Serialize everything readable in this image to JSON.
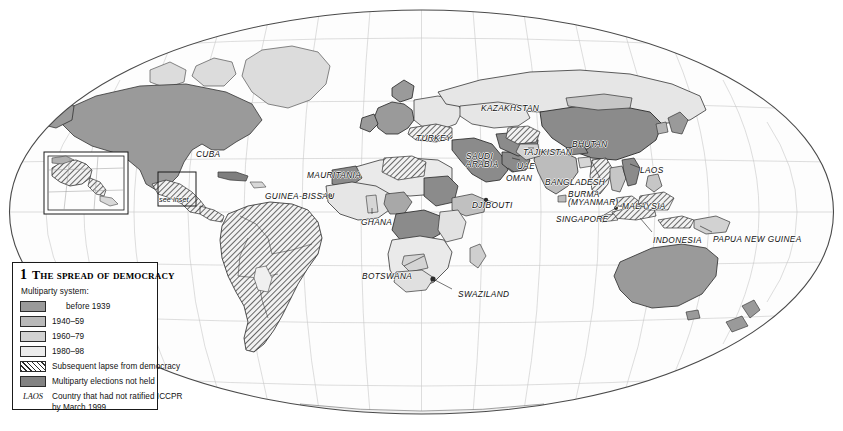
{
  "figure": {
    "number": "1",
    "title": "The spread of democracy",
    "projection": "oval-equal-area",
    "background_color": "#ffffff",
    "outline_color": "#4a4a4a"
  },
  "legend": {
    "subhead": "Multiparty system:",
    "entries": [
      {
        "label": "before 1939",
        "swatch": "solid",
        "color": "#9a9a9a"
      },
      {
        "label": "1940–59",
        "swatch": "solid",
        "color": "#b9b9b9"
      },
      {
        "label": "1960–79",
        "swatch": "solid",
        "color": "#d2d2d2"
      },
      {
        "label": "1980–98",
        "swatch": "solid",
        "color": "#ececec"
      },
      {
        "label": "Subsequent lapse from democracy",
        "swatch": "hatch",
        "color": "#ffffff"
      },
      {
        "label": "Multiparty elections not held",
        "swatch": "solid",
        "color": "#828282"
      }
    ],
    "code_entry": {
      "code": "LAOS",
      "label_line1": "Country that had not ratified ICCPR",
      "label_line2": "by March 1999"
    }
  },
  "map_labels": [
    {
      "id": "cuba",
      "text": "CUBA",
      "x": 196,
      "y": 150
    },
    {
      "id": "see-inset",
      "text": "see inset",
      "x": 159,
      "y": 196,
      "style": "small"
    },
    {
      "id": "mauritania",
      "text": "MAURITANIA",
      "x": 307,
      "y": 171
    },
    {
      "id": "guinea-bissau",
      "text": "GUINEA-BISSAU",
      "x": 265,
      "y": 192
    },
    {
      "id": "ghana",
      "text": "GHANA",
      "x": 361,
      "y": 218
    },
    {
      "id": "botswana",
      "text": "BOTSWANA",
      "x": 362,
      "y": 272
    },
    {
      "id": "swaziland",
      "text": "SWAZILAND",
      "x": 458,
      "y": 290
    },
    {
      "id": "djibouti",
      "text": "DJIBOUTI",
      "x": 472,
      "y": 201
    },
    {
      "id": "turkey",
      "text": "TURKEY",
      "x": 416,
      "y": 134
    },
    {
      "id": "kazakhstan",
      "text": "KAZAKHSTAN",
      "x": 481,
      "y": 104
    },
    {
      "id": "saudi-arabia",
      "text": "SAUDI\nARABIA",
      "x": 466,
      "y": 152
    },
    {
      "id": "uae",
      "text": "UAE",
      "x": 517,
      "y": 162
    },
    {
      "id": "oman",
      "text": "OMAN",
      "x": 506,
      "y": 174
    },
    {
      "id": "tajikistan",
      "text": "TAJIKISTAN",
      "x": 523,
      "y": 148
    },
    {
      "id": "bhutan",
      "text": "BHUTAN",
      "x": 572,
      "y": 140
    },
    {
      "id": "bangladesh",
      "text": "BANGLADESH",
      "x": 545,
      "y": 178
    },
    {
      "id": "laos",
      "text": "LAOS",
      "x": 640,
      "y": 166
    },
    {
      "id": "burma-myanmar",
      "text": "BURMA\n(MYANMAR)",
      "x": 568,
      "y": 190
    },
    {
      "id": "malaysia",
      "text": "MALAYSIA",
      "x": 622,
      "y": 202
    },
    {
      "id": "singapore",
      "text": "SINGAPORE",
      "x": 556,
      "y": 215
    },
    {
      "id": "indonesia",
      "text": "INDONESIA",
      "x": 653,
      "y": 236
    },
    {
      "id": "papua-new-guinea",
      "text": "PAPUA NEW GUINEA",
      "x": 713,
      "y": 235
    }
  ],
  "map_data": {
    "type": "choropleth-world",
    "categories": [
      "before 1939",
      "1940-59",
      "1960-79",
      "1980-98",
      "Subsequent lapse from democracy",
      "Multiparty elections not held"
    ],
    "category_colors": {
      "before 1939": "#9a9a9a",
      "1940-59": "#b9b9b9",
      "1960-79": "#d2d2d2",
      "1980-98": "#ececec",
      "Multiparty elections not held": "#828282",
      "lapse-hatch": "#2b2b2b"
    },
    "regions": [
      {
        "name": "North America (USA/Canada)",
        "category": "before 1939"
      },
      {
        "name": "Greenland",
        "category": "1980-98"
      },
      {
        "name": "Mexico",
        "category": "Subsequent lapse from democracy"
      },
      {
        "name": "Central America",
        "category": "Subsequent lapse from democracy"
      },
      {
        "name": "Cuba",
        "category": "Multiparty elections not held"
      },
      {
        "name": "South America",
        "category": "Subsequent lapse from democracy"
      },
      {
        "name": "Western Europe",
        "category": "before 1939"
      },
      {
        "name": "Eastern Europe",
        "category": "1980-98"
      },
      {
        "name": "Russia",
        "category": "1980-98"
      },
      {
        "name": "Turkey",
        "category": "Subsequent lapse from democracy"
      },
      {
        "name": "Saudi Arabia",
        "category": "Multiparty elections not held"
      },
      {
        "name": "Oman / UAE",
        "category": "Multiparty elections not held"
      },
      {
        "name": "Kazakhstan",
        "category": "1980-98"
      },
      {
        "name": "Tajikistan",
        "category": "Subsequent lapse from democracy"
      },
      {
        "name": "China",
        "category": "Multiparty elections not held"
      },
      {
        "name": "India",
        "category": "1940-59"
      },
      {
        "name": "Bhutan",
        "category": "Multiparty elections not held"
      },
      {
        "name": "Bangladesh",
        "category": "1960-79"
      },
      {
        "name": "Burma (Myanmar)",
        "category": "Subsequent lapse from democracy"
      },
      {
        "name": "Laos",
        "category": "Multiparty elections not held"
      },
      {
        "name": "Malaysia",
        "category": "Subsequent lapse from democracy"
      },
      {
        "name": "Indonesia",
        "category": "Subsequent lapse from democracy"
      },
      {
        "name": "Papua New Guinea",
        "category": "1960-79"
      },
      {
        "name": "Australia",
        "category": "before 1939"
      },
      {
        "name": "New Zealand",
        "category": "before 1939"
      },
      {
        "name": "Sub-Saharan Africa",
        "category": "1980-98"
      },
      {
        "name": "Central Africa",
        "category": "Multiparty elections not held"
      },
      {
        "name": "Mauritania",
        "category": "Multiparty elections not held"
      },
      {
        "name": "Botswana",
        "category": "1960-79"
      },
      {
        "name": "South Africa",
        "category": "1980-98"
      },
      {
        "name": "Antarctica",
        "category": "1980-98"
      }
    ]
  },
  "inset": {
    "label": "see inset",
    "description": "Central America detail"
  }
}
